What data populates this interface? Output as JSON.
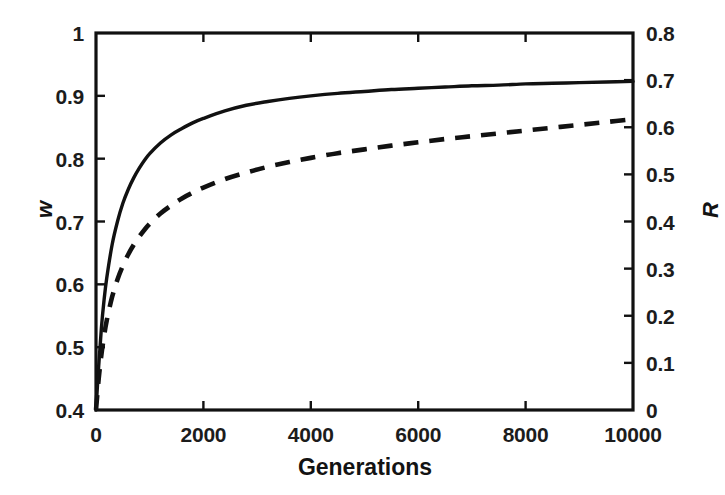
{
  "chart_data": {
    "type": "line",
    "title": "",
    "subtitle": "",
    "xlabel": "Generations",
    "ylabel": "w",
    "ylabel_right": "R",
    "xlim": [
      0,
      10000
    ],
    "ylim": [
      0.4,
      1
    ],
    "ylim_right": [
      0,
      0.8
    ],
    "grid": false,
    "legend": "none",
    "xticks": [
      0,
      2000,
      4000,
      6000,
      8000,
      10000
    ],
    "xtick_labels": [
      "0",
      "2000",
      "4000",
      "6000",
      "8000",
      "10000"
    ],
    "yticks_left": [
      0.4,
      0.5,
      0.6,
      0.7,
      0.8,
      0.9,
      1
    ],
    "ytick_labels_left": [
      "0.4",
      "0.5",
      "0.6",
      "0.7",
      "0.8",
      "0.9",
      "1"
    ],
    "yticks_right": [
      0,
      0.1,
      0.2,
      0.3,
      0.4,
      0.5,
      0.6,
      0.7,
      0.8
    ],
    "ytick_labels_right": [
      "0",
      "0.1",
      "0.2",
      "0.3",
      "0.4",
      "0.5",
      "0.6",
      "0.7",
      "0.8"
    ],
    "x": [
      0,
      50,
      100,
      150,
      200,
      300,
      400,
      500,
      600,
      700,
      800,
      900,
      1000,
      1200,
      1400,
      1600,
      1800,
      2000,
      2400,
      2800,
      3200,
      3600,
      4000,
      4500,
      5000,
      5500,
      6000,
      6500,
      7000,
      7500,
      8000,
      8500,
      9000,
      9500,
      10000
    ],
    "series": [
      {
        "name": "w",
        "axis": "left",
        "style": "solid",
        "color": "#111111",
        "values": [
          0.4,
          0.47,
          0.53,
          0.575,
          0.61,
          0.663,
          0.7,
          0.729,
          0.751,
          0.769,
          0.784,
          0.797,
          0.808,
          0.825,
          0.838,
          0.848,
          0.857,
          0.864,
          0.876,
          0.885,
          0.891,
          0.896,
          0.9,
          0.904,
          0.907,
          0.91,
          0.912,
          0.914,
          0.916,
          0.917,
          0.919,
          0.92,
          0.921,
          0.922,
          0.923
        ]
      },
      {
        "name": "R",
        "axis": "right",
        "style": "dashed",
        "color": "#111111",
        "values": [
          0.0,
          0.066,
          0.117,
          0.157,
          0.19,
          0.24,
          0.277,
          0.306,
          0.33,
          0.35,
          0.367,
          0.382,
          0.395,
          0.417,
          0.434,
          0.449,
          0.461,
          0.472,
          0.49,
          0.504,
          0.516,
          0.526,
          0.535,
          0.545,
          0.553,
          0.561,
          0.568,
          0.575,
          0.581,
          0.587,
          0.593,
          0.599,
          0.605,
          0.611,
          0.617
        ]
      }
    ],
    "annotations": []
  },
  "figure": {
    "background_color": "#ffffff",
    "axis_color": "#111111"
  }
}
